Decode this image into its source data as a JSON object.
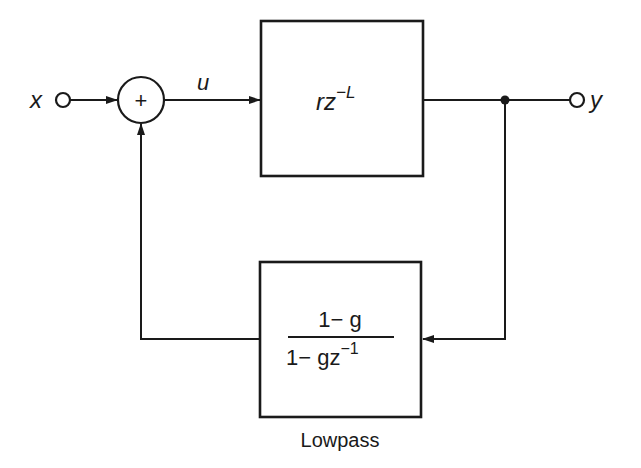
{
  "diagram": {
    "type": "block-diagram",
    "input": {
      "label": "x"
    },
    "output": {
      "label": "y"
    },
    "summer": {
      "symbol": "+"
    },
    "signal_u": {
      "label": "u"
    },
    "delay_block": {
      "base": "rz",
      "exponent": "−L"
    },
    "lowpass_block": {
      "numerator": "1− g",
      "denominator_base": "1− gz",
      "denominator_exponent": "−1",
      "caption": "Lowpass"
    },
    "colors": {
      "line": "#1a1a1a",
      "background": "#ffffff"
    }
  }
}
